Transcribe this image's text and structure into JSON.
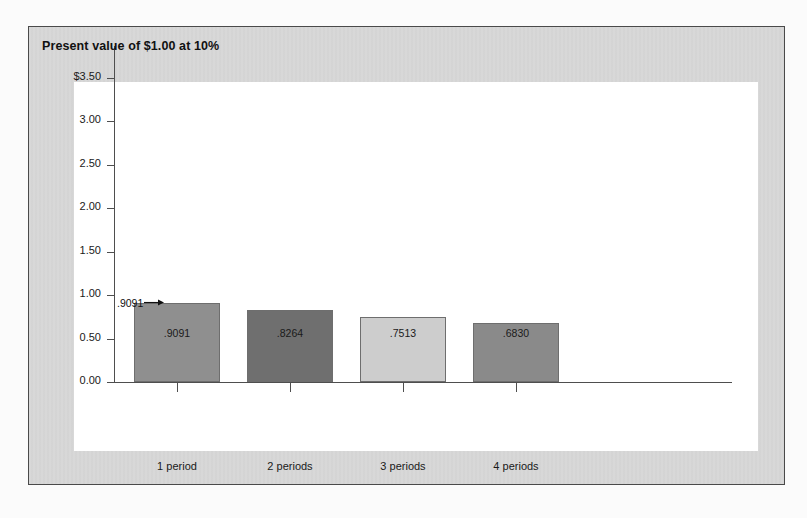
{
  "figure": {
    "title": "Present value of $1.00 at 10%",
    "frame_color": "#d7d7d7",
    "frame_border_color": "#4a4a4a",
    "plot_background": "#ffffff",
    "axis_color": "#4e4e4e"
  },
  "callout": {
    "label": ".9091",
    "arrow_glyph": "arrow-right-icon",
    "points_to": "1 period"
  },
  "chart_data": {
    "type": "bar",
    "title": "Present value of $1.00 at 10%",
    "xlabel": "",
    "ylabel": "",
    "categories": [
      "1 period",
      "2 periods",
      "3 periods",
      "4 periods"
    ],
    "values": [
      0.9091,
      0.8264,
      0.7513,
      0.683
    ],
    "value_labels": [
      ".9091",
      ".8264",
      ".7513",
      ".6830"
    ],
    "bar_colors": [
      "#8f8f8f",
      "#6f6f6f",
      "#cdcdcd",
      "#8a8a8a"
    ],
    "bar_border_color": "#6e6e6e",
    "ylim": [
      0.0,
      3.9
    ],
    "ytick_values": [
      0.0,
      0.5,
      1.0,
      1.5,
      2.0,
      2.5,
      3.0,
      3.5
    ],
    "ytick_labels": [
      "0.00",
      "0.50",
      "1.00",
      "1.50",
      "2.00",
      "2.50",
      "3.00",
      "$3.50"
    ],
    "grid": false,
    "legend": "none"
  }
}
